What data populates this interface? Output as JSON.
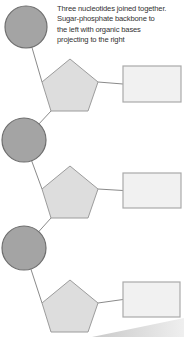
{
  "caption": {
    "line1": "Three nucleotides joined together.",
    "line2": "Sugar-phosphate backbone to",
    "line3": "the left with organic bases",
    "line4": "projecting to the right"
  },
  "diagram": {
    "type": "schematic",
    "legend": {
      "circle": "phosphate-group",
      "pentagon": "sugar",
      "rectangle": "organic-base"
    },
    "colors": {
      "background": "#ffffff",
      "phosphate_fill": "#a4a4a4",
      "phosphate_stroke": "#6e6e6e",
      "sugar_fill": "#dddddd",
      "sugar_stroke": "#9c9c9c",
      "base_fill": "#f1f1f1",
      "base_stroke": "#aaaaaa",
      "bond_stroke": "#8a8a8a",
      "page_shadow_left": "#c9c9c9",
      "page_shadow_right": "#efefef",
      "caption_text": "#333333"
    },
    "units": [
      {
        "name": "nucleotide-1",
        "phosphate": {
          "cx": 26,
          "cy": 27,
          "r": 21
        },
        "sugar": {
          "apexX": 70,
          "apexY": 59
        },
        "base": {
          "x": 123,
          "y": 66,
          "w": 58,
          "h": 36
        }
      },
      {
        "name": "nucleotide-2",
        "phosphate": {
          "cx": 24,
          "cy": 140,
          "r": 22
        },
        "sugar": {
          "apexX": 70,
          "apexY": 166
        },
        "base": {
          "x": 123,
          "y": 173,
          "w": 58,
          "h": 35
        }
      },
      {
        "name": "nucleotide-3",
        "phosphate": {
          "cx": 24,
          "cy": 248,
          "r": 22
        },
        "sugar": {
          "apexX": 70,
          "apexY": 280
        },
        "base": {
          "x": 123,
          "y": 282,
          "w": 57,
          "h": 35
        }
      }
    ],
    "pentagon_offsets": {
      "apex": [
        0,
        0
      ],
      "left": [
        -28,
        23
      ],
      "right": [
        28,
        23
      ],
      "bottom_right": [
        18,
        52
      ],
      "bottom_left": [
        -19,
        52
      ]
    },
    "page_corner_shadow": {
      "points": "92,337 184,318 184,337"
    }
  }
}
